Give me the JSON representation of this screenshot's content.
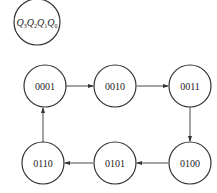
{
  "diagram": {
    "type": "state-transition",
    "legend": {
      "label": "Q3Q2Q1Q0",
      "parts": [
        {
          "var": "Q",
          "sub": "3"
        },
        {
          "var": "Q",
          "sub": "2"
        },
        {
          "var": "Q",
          "sub": "1"
        },
        {
          "var": "Q",
          "sub": "0"
        }
      ]
    },
    "states": [
      {
        "id": "s1",
        "label": "0001"
      },
      {
        "id": "s2",
        "label": "0010"
      },
      {
        "id": "s3",
        "label": "0011"
      },
      {
        "id": "s4",
        "label": "0100"
      },
      {
        "id": "s5",
        "label": "0101"
      },
      {
        "id": "s6",
        "label": "0110"
      }
    ],
    "transitions": [
      {
        "from": "0001",
        "to": "0010"
      },
      {
        "from": "0010",
        "to": "0011"
      },
      {
        "from": "0011",
        "to": "0100"
      },
      {
        "from": "0100",
        "to": "0101"
      },
      {
        "from": "0101",
        "to": "0110"
      },
      {
        "from": "0110",
        "to": "0001"
      }
    ]
  }
}
